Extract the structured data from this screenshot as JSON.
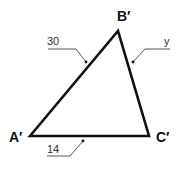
{
  "diagram": {
    "type": "triangle",
    "vertices": {
      "A": {
        "label": "A′",
        "x": 30,
        "y": 136
      },
      "B": {
        "label": "B′",
        "x": 118,
        "y": 31
      },
      "C": {
        "label": "C′",
        "x": 149,
        "y": 136
      }
    },
    "sides": {
      "AB": {
        "label": "30"
      },
      "BC": {
        "label": "y"
      },
      "AC": {
        "label": "14"
      }
    },
    "colors": {
      "stroke": "#111111",
      "leader": "#444444",
      "background": "#ffffff"
    }
  }
}
